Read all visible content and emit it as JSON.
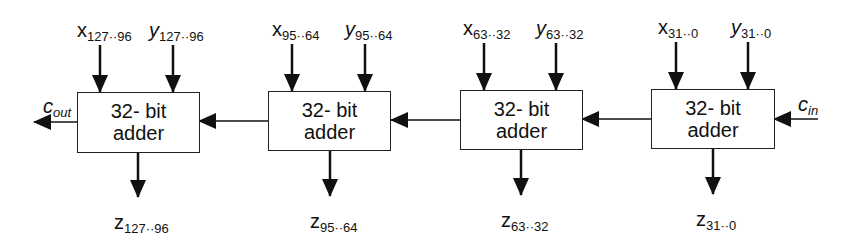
{
  "diagram": {
    "adders": [
      {
        "line1": "32- bit",
        "line2": "adder",
        "x_var": "x",
        "x_sub": "127··96",
        "y_var": "y",
        "y_sub": "127··96",
        "z_var": "z",
        "z_sub": "127··96"
      },
      {
        "line1": "32- bit",
        "line2": "adder",
        "x_var": "x",
        "x_sub": "95··64",
        "y_var": "y",
        "y_sub": "95··64",
        "z_var": "z",
        "z_sub": "95··64"
      },
      {
        "line1": "32- bit",
        "line2": "adder",
        "x_var": "x",
        "x_sub": "63··32",
        "y_var": "y",
        "y_sub": "63··32",
        "z_var": "z",
        "z_sub": "63··32"
      },
      {
        "line1": "32- bit",
        "line2": "adder",
        "x_var": "x",
        "x_sub": "31··0",
        "y_var": "y",
        "y_sub": "31··0",
        "z_var": "z",
        "z_sub": "31··0"
      }
    ],
    "carry_out": {
      "var": "c",
      "sub": "out"
    },
    "carry_in": {
      "var": "c",
      "sub": "in"
    },
    "colors": {
      "stroke": "#111111",
      "background": "#ffffff"
    }
  }
}
